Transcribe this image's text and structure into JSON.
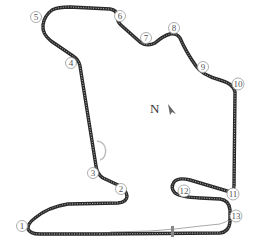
{
  "map": {
    "type": "race-circuit-layout",
    "track_color": "#2a2a2a",
    "track_dash_color": "#bbbbbb",
    "runoff_color": "#bdbdbd",
    "pitlane_color": "#aaaaaa",
    "north_label": "N",
    "corners": [
      {
        "number": "1",
        "x": 22,
        "y": 226
      },
      {
        "number": "2",
        "x": 121,
        "y": 189
      },
      {
        "number": "3",
        "x": 93,
        "y": 173
      },
      {
        "number": "4",
        "x": 71,
        "y": 63
      },
      {
        "number": "5",
        "x": 36,
        "y": 17
      },
      {
        "number": "6",
        "x": 120,
        "y": 16
      },
      {
        "number": "7",
        "x": 146,
        "y": 38
      },
      {
        "number": "8",
        "x": 174,
        "y": 28
      },
      {
        "number": "9",
        "x": 203,
        "y": 67
      },
      {
        "number": "10",
        "x": 238,
        "y": 84
      },
      {
        "number": "11",
        "x": 233,
        "y": 194
      },
      {
        "number": "12",
        "x": 184,
        "y": 191
      },
      {
        "number": "13",
        "x": 236,
        "y": 216
      }
    ]
  }
}
